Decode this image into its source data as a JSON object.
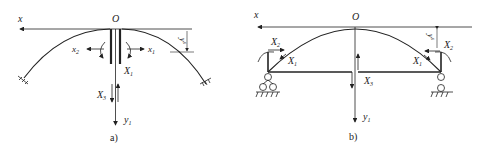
{
  "figure": {
    "panels": [
      {
        "id": "a",
        "caption": "a)",
        "origin_label": "O",
        "axis_x_label": "x",
        "labels": {
          "x2": "x",
          "x2_sub": "2",
          "x1": "x",
          "x1_sub": "1",
          "X1": "X",
          "X1_sub": "1",
          "X3": "X",
          "X3_sub": "3",
          "y1": "y",
          "y1_sub": "1",
          "ys": "y",
          "ys_sub": "s"
        }
      },
      {
        "id": "b",
        "caption": "b)",
        "origin_label": "O",
        "axis_x_label": "x",
        "labels": {
          "X2_left": "X",
          "X2_left_sub": "2",
          "X1_left": "X",
          "X1_left_sub": "1",
          "X2_right": "X",
          "X2_right_sub": "2",
          "X1_right": "X",
          "X1_right_sub": "1",
          "X3": "X",
          "X3_sub": "3",
          "y1": "y",
          "y1_sub": "1",
          "ys": "y",
          "ys_sub": "s"
        }
      }
    ]
  }
}
